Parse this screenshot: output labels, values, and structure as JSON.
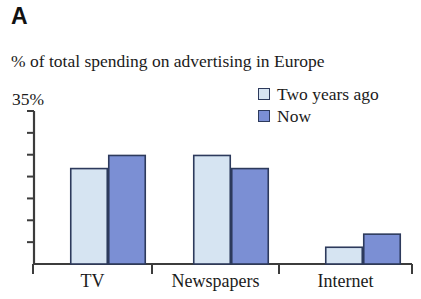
{
  "panel": {
    "label": "A"
  },
  "legend": {
    "items": [
      {
        "label": "Two years ago",
        "color": "#d6e4f2"
      },
      {
        "label": "Now",
        "color": "#7b8fd4"
      }
    ]
  },
  "axis": {
    "y_max_label": "35%"
  },
  "categories": [
    {
      "label": "TV"
    },
    {
      "label": "Newspapers"
    },
    {
      "label": "Internet"
    }
  ],
  "chart_data": {
    "type": "bar",
    "title": "% of total spending on advertising in Europe",
    "panel_label": "A",
    "xlabel": "",
    "ylabel": "% of total spending on advertising in Europe",
    "ylim": [
      0,
      35
    ],
    "y_max_label": "35%",
    "y_tick_interval": 5,
    "y_ticks": [
      0,
      5,
      10,
      15,
      20,
      25,
      30,
      35
    ],
    "grid": false,
    "legend_position": "top-right",
    "categories": [
      "TV",
      "Newspapers",
      "Internet"
    ],
    "series": [
      {
        "name": "Two years ago",
        "color": "#d6e4f2",
        "values": [
          22,
          25,
          4
        ]
      },
      {
        "name": "Now",
        "color": "#7b8fd4",
        "values": [
          25,
          22,
          7
        ]
      }
    ],
    "colors": {
      "series_light": "#d6e4f2",
      "series_dark": "#7b8fd4",
      "bar_border": "#2d3a5c",
      "axis": "#3c3c3c",
      "text": "#1b1b1b",
      "background": "#ffffff"
    }
  }
}
